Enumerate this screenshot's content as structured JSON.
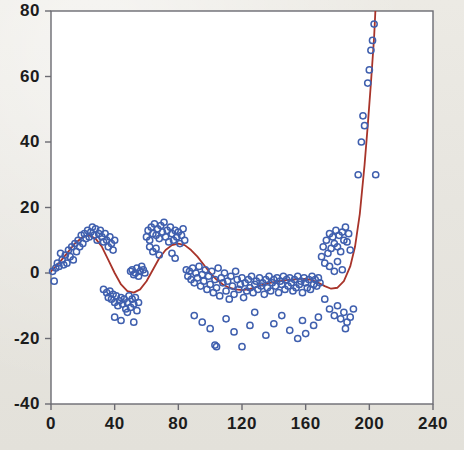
{
  "figure": {
    "background_color": "#e8e7e2",
    "plot_background_color": "#ffffff",
    "frame_color": "#6b6b72",
    "marker_color": "#3f5fae",
    "curve_color": "#a8342a"
  },
  "axes": {
    "x_ticks": [
      "0",
      "40",
      "80",
      "120",
      "160",
      "200",
      "240"
    ],
    "y_ticks": [
      "80",
      "60",
      "40",
      "20",
      "0",
      "-20",
      "-40"
    ]
  },
  "chart_data": {
    "type": "scatter",
    "title": "",
    "subtitle": "",
    "xlabel": "",
    "ylabel": "",
    "xlim": [
      0,
      240
    ],
    "ylim": [
      -40,
      80
    ],
    "xticks": [
      0,
      40,
      80,
      120,
      160,
      200,
      240
    ],
    "yticks": [
      -40,
      -20,
      0,
      20,
      40,
      60,
      80
    ],
    "grid": false,
    "legend": null,
    "legend_position": "none",
    "annotations": [],
    "series": [
      {
        "name": "observations",
        "type": "scatter",
        "marker": "open-circle",
        "color": "#3f5fae",
        "points": [
          [
            1,
            0.5
          ],
          [
            2,
            -2.5
          ],
          [
            3,
            1.5
          ],
          [
            4,
            3.0
          ],
          [
            5,
            2.0
          ],
          [
            6,
            6.0
          ],
          [
            7,
            4.0
          ],
          [
            8,
            2.5
          ],
          [
            9,
            5.5
          ],
          [
            10,
            3.0
          ],
          [
            11,
            7.0
          ],
          [
            12,
            5.0
          ],
          [
            13,
            8.0
          ],
          [
            14,
            4.0
          ],
          [
            15,
            9.0
          ],
          [
            16,
            6.5
          ],
          [
            17,
            10.0
          ],
          [
            18,
            8.0
          ],
          [
            19,
            11.5
          ],
          [
            20,
            9.0
          ],
          [
            21,
            12.0
          ],
          [
            22,
            10.5
          ],
          [
            23,
            13.0
          ],
          [
            24,
            11.0
          ],
          [
            25,
            12.5
          ],
          [
            26,
            14.0
          ],
          [
            27,
            11.5
          ],
          [
            28,
            13.5
          ],
          [
            29,
            10.0
          ],
          [
            30,
            12.0
          ],
          [
            31,
            13.0
          ],
          [
            32,
            11.0
          ],
          [
            33,
            9.5
          ],
          [
            34,
            12.0
          ],
          [
            35,
            10.0
          ],
          [
            36,
            8.0
          ],
          [
            37,
            11.0
          ],
          [
            38,
            9.0
          ],
          [
            39,
            7.0
          ],
          [
            40,
            10.0
          ],
          [
            33,
            -5.0
          ],
          [
            35,
            -6.0
          ],
          [
            36,
            -7.5
          ],
          [
            37,
            -5.5
          ],
          [
            38,
            -8.0
          ],
          [
            39,
            -6.5
          ],
          [
            40,
            -9.0
          ],
          [
            41,
            -7.0
          ],
          [
            42,
            -10.0
          ],
          [
            43,
            -8.5
          ],
          [
            44,
            -7.5
          ],
          [
            45,
            -9.5
          ],
          [
            46,
            -8.0
          ],
          [
            47,
            -11.0
          ],
          [
            48,
            -9.0
          ],
          [
            49,
            -7.0
          ],
          [
            50,
            -10.5
          ],
          [
            51,
            -8.0
          ],
          [
            52,
            -9.5
          ],
          [
            53,
            -7.5
          ],
          [
            54,
            -11.5
          ],
          [
            55,
            -9.0
          ],
          [
            40,
            -13.5
          ],
          [
            44,
            -14.5
          ],
          [
            48,
            -12.0
          ],
          [
            52,
            -15.0
          ],
          [
            50,
            0.5
          ],
          [
            51,
            1.0
          ],
          [
            52,
            -0.5
          ],
          [
            53,
            0.0
          ],
          [
            54,
            1.5
          ],
          [
            55,
            -1.0
          ],
          [
            56,
            0.5
          ],
          [
            57,
            2.0
          ],
          [
            58,
            1.0
          ],
          [
            59,
            0.0
          ],
          [
            60,
            11.0
          ],
          [
            61,
            13.0
          ],
          [
            62,
            10.0
          ],
          [
            63,
            14.0
          ],
          [
            64,
            12.0
          ],
          [
            65,
            15.0
          ],
          [
            66,
            11.5
          ],
          [
            67,
            13.5
          ],
          [
            68,
            10.5
          ],
          [
            69,
            14.5
          ],
          [
            70,
            12.5
          ],
          [
            71,
            15.5
          ],
          [
            72,
            11.0
          ],
          [
            73,
            13.0
          ],
          [
            74,
            9.5
          ],
          [
            75,
            14.0
          ],
          [
            76,
            12.0
          ],
          [
            77,
            10.0
          ],
          [
            78,
            13.0
          ],
          [
            79,
            11.0
          ],
          [
            80,
            12.5
          ],
          [
            81,
            9.0
          ],
          [
            82,
            11.5
          ],
          [
            83,
            13.5
          ],
          [
            84,
            10.0
          ],
          [
            62,
            8.0
          ],
          [
            64,
            6.5
          ],
          [
            66,
            7.5
          ],
          [
            68,
            5.5
          ],
          [
            76,
            6.0
          ],
          [
            78,
            4.5
          ],
          [
            85,
            1.0
          ],
          [
            86,
            -1.0
          ],
          [
            87,
            0.5
          ],
          [
            88,
            -2.0
          ],
          [
            89,
            1.5
          ],
          [
            90,
            -3.0
          ],
          [
            91,
            0.0
          ],
          [
            92,
            -1.5
          ],
          [
            93,
            2.0
          ],
          [
            94,
            -4.0
          ],
          [
            95,
            -0.5
          ],
          [
            96,
            -2.5
          ],
          [
            97,
            1.0
          ],
          [
            98,
            -5.0
          ],
          [
            99,
            -1.0
          ],
          [
            100,
            -3.5
          ],
          [
            101,
            0.5
          ],
          [
            102,
            -6.0
          ],
          [
            103,
            -2.0
          ],
          [
            104,
            -4.5
          ],
          [
            105,
            1.5
          ],
          [
            106,
            -7.0
          ],
          [
            107,
            -1.5
          ],
          [
            108,
            -3.0
          ],
          [
            109,
            0.0
          ],
          [
            110,
            -5.5
          ],
          [
            111,
            -2.5
          ],
          [
            112,
            -8.0
          ],
          [
            113,
            -1.0
          ],
          [
            114,
            -4.0
          ],
          [
            115,
            -6.5
          ],
          [
            116,
            0.5
          ],
          [
            117,
            -2.0
          ],
          [
            118,
            -5.0
          ],
          [
            119,
            -3.5
          ],
          [
            120,
            -1.5
          ],
          [
            121,
            -7.5
          ],
          [
            122,
            -3.0
          ],
          [
            123,
            -5.5
          ],
          [
            124,
            -2.0
          ],
          [
            125,
            -4.5
          ],
          [
            126,
            -1.0
          ],
          [
            127,
            -6.0
          ],
          [
            128,
            -3.5
          ],
          [
            129,
            -2.5
          ],
          [
            130,
            -5.0
          ],
          [
            131,
            -1.5
          ],
          [
            132,
            -4.0
          ],
          [
            133,
            -3.0
          ],
          [
            134,
            -6.5
          ],
          [
            135,
            -2.0
          ],
          [
            136,
            -4.5
          ],
          [
            137,
            -1.0
          ],
          [
            138,
            -5.5
          ],
          [
            139,
            -3.0
          ],
          [
            140,
            -2.0
          ],
          [
            141,
            -4.0
          ],
          [
            142,
            -1.5
          ],
          [
            143,
            -6.0
          ],
          [
            144,
            -2.5
          ],
          [
            145,
            -3.5
          ],
          [
            146,
            -1.0
          ],
          [
            147,
            -5.0
          ],
          [
            148,
            -2.0
          ],
          [
            149,
            -4.0
          ],
          [
            150,
            -1.5
          ],
          [
            151,
            -3.0
          ],
          [
            152,
            -5.5
          ],
          [
            153,
            -2.0
          ],
          [
            154,
            -4.5
          ],
          [
            155,
            -1.0
          ],
          [
            156,
            -3.5
          ],
          [
            157,
            -2.5
          ],
          [
            158,
            -6.0
          ],
          [
            159,
            -1.5
          ],
          [
            160,
            -3.0
          ],
          [
            161,
            -4.5
          ],
          [
            162,
            -2.0
          ],
          [
            163,
            -5.0
          ],
          [
            164,
            -1.0
          ],
          [
            165,
            -3.5
          ],
          [
            166,
            -2.0
          ],
          [
            167,
            -4.0
          ],
          [
            168,
            -1.5
          ],
          [
            169,
            -3.0
          ],
          [
            90,
            -13.0
          ],
          [
            95,
            -15.0
          ],
          [
            100,
            -17.0
          ],
          [
            103,
            -22.0
          ],
          [
            104,
            -22.5
          ],
          [
            110,
            -14.0
          ],
          [
            115,
            -18.0
          ],
          [
            120,
            -22.5
          ],
          [
            125,
            -16.0
          ],
          [
            128,
            -12.0
          ],
          [
            135,
            -19.0
          ],
          [
            140,
            -15.5
          ],
          [
            145,
            -13.0
          ],
          [
            150,
            -17.5
          ],
          [
            155,
            -20.0
          ],
          [
            158,
            -14.5
          ],
          [
            160,
            -18.5
          ],
          [
            165,
            -16.0
          ],
          [
            168,
            -13.5
          ],
          [
            170,
            5.0
          ],
          [
            171,
            8.0
          ],
          [
            172,
            3.0
          ],
          [
            173,
            10.0
          ],
          [
            174,
            6.0
          ],
          [
            175,
            12.0
          ],
          [
            176,
            7.5
          ],
          [
            177,
            11.0
          ],
          [
            178,
            9.0
          ],
          [
            179,
            13.0
          ],
          [
            180,
            8.0
          ],
          [
            181,
            11.5
          ],
          [
            182,
            6.5
          ],
          [
            183,
            12.5
          ],
          [
            184,
            10.0
          ],
          [
            185,
            14.0
          ],
          [
            186,
            9.5
          ],
          [
            187,
            12.0
          ],
          [
            188,
            7.0
          ],
          [
            175,
            2.0
          ],
          [
            178,
            0.5
          ],
          [
            180,
            3.5
          ],
          [
            183,
            1.0
          ],
          [
            172,
            -8.0
          ],
          [
            175,
            -11.0
          ],
          [
            178,
            -13.0
          ],
          [
            180,
            -10.0
          ],
          [
            182,
            -14.0
          ],
          [
            184,
            -12.0
          ],
          [
            186,
            -15.0
          ],
          [
            188,
            -13.5
          ],
          [
            190,
            -11.0
          ],
          [
            185,
            -17.0
          ],
          [
            193,
            30.0
          ],
          [
            195,
            40.0
          ],
          [
            196,
            48.0
          ],
          [
            197,
            45.0
          ],
          [
            199,
            58.0
          ],
          [
            200,
            62.0
          ],
          [
            201,
            68.0
          ],
          [
            202,
            71.0
          ],
          [
            203,
            76.0
          ],
          [
            204,
            30.0
          ]
        ]
      },
      {
        "name": "fitted-curve",
        "type": "line",
        "color": "#a8342a",
        "points": [
          [
            0,
            0.5
          ],
          [
            5,
            3.0
          ],
          [
            10,
            6.0
          ],
          [
            15,
            9.0
          ],
          [
            20,
            11.0
          ],
          [
            24,
            11.5
          ],
          [
            28,
            10.5
          ],
          [
            32,
            8.0
          ],
          [
            36,
            4.0
          ],
          [
            40,
            0.0
          ],
          [
            44,
            -3.5
          ],
          [
            48,
            -5.5
          ],
          [
            52,
            -6.0
          ],
          [
            56,
            -5.0
          ],
          [
            60,
            -2.5
          ],
          [
            64,
            1.0
          ],
          [
            68,
            4.5
          ],
          [
            72,
            7.0
          ],
          [
            76,
            8.5
          ],
          [
            80,
            9.0
          ],
          [
            84,
            8.5
          ],
          [
            88,
            7.0
          ],
          [
            92,
            5.0
          ],
          [
            96,
            2.5
          ],
          [
            100,
            0.0
          ],
          [
            104,
            -2.0
          ],
          [
            108,
            -3.5
          ],
          [
            112,
            -4.5
          ],
          [
            116,
            -5.0
          ],
          [
            120,
            -5.2
          ],
          [
            124,
            -5.0
          ],
          [
            128,
            -4.5
          ],
          [
            132,
            -3.8
          ],
          [
            136,
            -3.2
          ],
          [
            140,
            -2.8
          ],
          [
            144,
            -2.5
          ],
          [
            148,
            -2.2
          ],
          [
            152,
            -2.0
          ],
          [
            156,
            -1.8
          ],
          [
            160,
            -1.8
          ],
          [
            164,
            -2.2
          ],
          [
            168,
            -3.0
          ],
          [
            172,
            -4.0
          ],
          [
            176,
            -4.8
          ],
          [
            180,
            -4.5
          ],
          [
            184,
            -2.5
          ],
          [
            188,
            2.0
          ],
          [
            191,
            8.0
          ],
          [
            194,
            18.0
          ],
          [
            197,
            33.0
          ],
          [
            199,
            45.0
          ],
          [
            201,
            58.0
          ],
          [
            203,
            72.0
          ],
          [
            204,
            82.0
          ]
        ]
      }
    ]
  }
}
